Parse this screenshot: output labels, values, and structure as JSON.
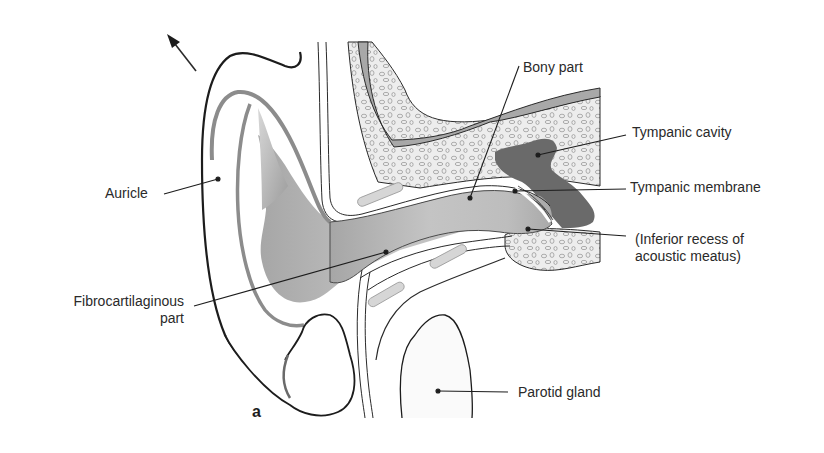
{
  "figure": {
    "panel_letter": "a",
    "colors": {
      "background": "#ffffff",
      "outline": "#1c1c1c",
      "canal_fill": "#b9b9b9",
      "bone_fill": "#ececec",
      "cortex_fill": "#a9a9a9",
      "tympanic_cavity": "#6a6a6a",
      "cartilage_bar": "#d6d6d6",
      "label_text": "#2a2a2a"
    }
  },
  "labels": {
    "auricle": "Auricle",
    "fibrocartilaginous_line1": "Fibrocartilaginous",
    "fibrocartilaginous_line2": "part",
    "bony_part": "Bony part",
    "tympanic_cavity": "Tympanic cavity",
    "tympanic_membrane": "Tympanic membrane",
    "inferior_recess_line1": "(Inferior recess of",
    "inferior_recess_line2": "acoustic meatus)",
    "parotid_gland": "Parotid gland"
  }
}
